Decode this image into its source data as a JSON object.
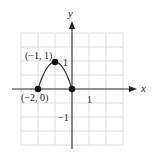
{
  "chart_data": {
    "type": "line",
    "title": "",
    "xlabel": "x",
    "ylabel": "y",
    "xlim": [
      -3,
      3
    ],
    "ylim": [
      -2,
      2
    ],
    "grid": true,
    "x_ticks_labeled": [
      1
    ],
    "y_ticks_labeled": [
      1,
      -1
    ],
    "tick_labels": {
      "x_one": "1",
      "y_one": "1",
      "y_neg_one": "−1"
    },
    "series": [
      {
        "name": "curve",
        "shape": "parabola arc",
        "equation_inferred": "y = -x^2 - 2x, -2 <= x <= 0",
        "x": [
          -2,
          -1.5,
          -1,
          -0.5,
          0
        ],
        "y": [
          0,
          0.75,
          1,
          0.75,
          0
        ]
      }
    ],
    "points": [
      {
        "x": -2,
        "y": 0,
        "label": "(−2, 0)"
      },
      {
        "x": -1,
        "y": 1,
        "label": "(−1, 1)"
      },
      {
        "x": 0,
        "y": 0,
        "label": ""
      }
    ],
    "annotations": [
      "(−1, 1)",
      "(−2, 0)"
    ]
  },
  "colors": {
    "axis": "#333333",
    "grid": "#d6d6d6",
    "curve": "#333333",
    "point": "#111111",
    "background": "#ffffff"
  }
}
